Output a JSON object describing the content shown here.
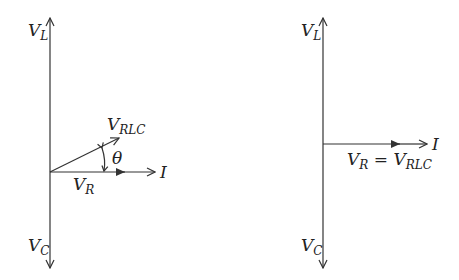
{
  "diagrams": [
    {
      "name": "phasor-rlc-general",
      "labels": {
        "vl": {
          "main": "V",
          "sub": "L"
        },
        "vc": {
          "main": "V",
          "sub": "C"
        },
        "vrlc": {
          "main": "V",
          "sub": "RLC"
        },
        "vr": {
          "main": "V",
          "sub": "R"
        },
        "theta": "θ",
        "current": "I"
      }
    },
    {
      "name": "phasor-rlc-resonance",
      "labels": {
        "vl": {
          "main": "V",
          "sub": "L"
        },
        "vc": {
          "main": "V",
          "sub": "C"
        },
        "vr_eq": {
          "main1": "V",
          "sub1": "R",
          "eq": " = ",
          "main2": "V",
          "sub2": "RLC"
        },
        "current": "I"
      }
    }
  ],
  "colors": {
    "line": "#333333",
    "text": "#222222",
    "background": "#ffffff"
  }
}
